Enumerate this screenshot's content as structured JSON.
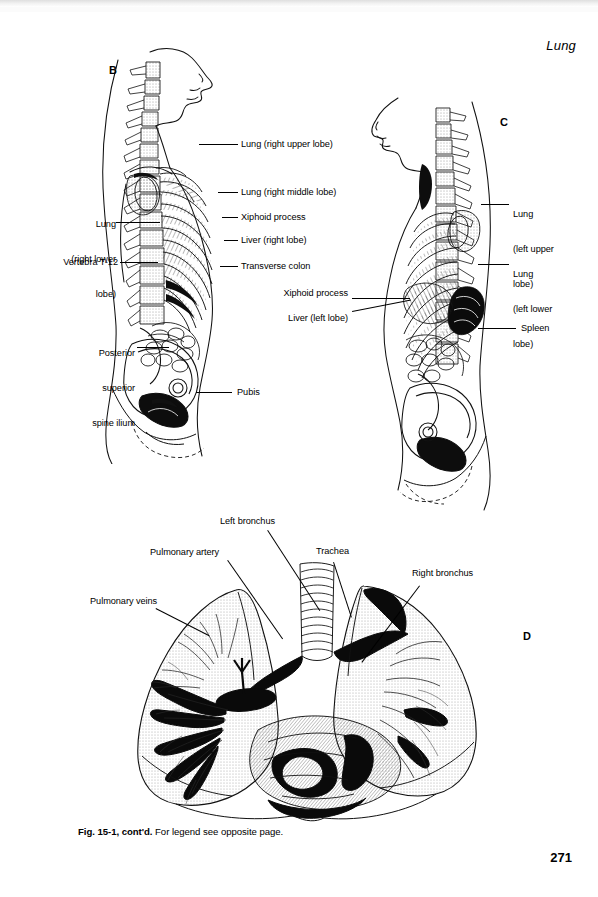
{
  "page": {
    "running_head": "Lung",
    "folio": "271",
    "caption_figure": "Fig. 15-1, cont'd.",
    "caption_text": " For legend see opposite page."
  },
  "panels": [
    {
      "letter": "B",
      "name": "panel-b-right-lateral-torso",
      "labels_left": [
        {
          "id": "lung-right-lower-lobe",
          "lines": [
            "Lung",
            "(right lower",
            "lobe)"
          ]
        },
        {
          "id": "vertebra-t12",
          "lines": [
            "Vertebra T-12"
          ]
        },
        {
          "id": "posterior-superior-spine-ilium",
          "lines": [
            "Posterior",
            "superior",
            "spine ilium"
          ]
        }
      ],
      "labels_right": [
        {
          "id": "lung-right-upper-lobe",
          "lines": [
            "Lung (right upper lobe)"
          ]
        },
        {
          "id": "lung-right-middle-lobe",
          "lines": [
            "Lung (right middle lobe)"
          ]
        },
        {
          "id": "xiphoid-process",
          "lines": [
            "Xiphoid process"
          ]
        },
        {
          "id": "liver-right-lobe",
          "lines": [
            "Liver (right lobe)"
          ]
        },
        {
          "id": "transverse-colon",
          "lines": [
            "Transverse colon"
          ]
        },
        {
          "id": "pubis",
          "lines": [
            "Pubis"
          ]
        }
      ]
    },
    {
      "letter": "C",
      "name": "panel-c-left-lateral-torso",
      "labels_left": [
        {
          "id": "xiphoid-process",
          "lines": [
            "Xiphoid process"
          ]
        },
        {
          "id": "liver-left-lobe",
          "lines": [
            "Liver (left lobe)"
          ]
        }
      ],
      "labels_right": [
        {
          "id": "lung-left-upper-lobe",
          "lines": [
            "Lung",
            "(left upper",
            "lobe)"
          ]
        },
        {
          "id": "lung-left-lower-lobe",
          "lines": [
            "Lung",
            "(left lower",
            "lobe)"
          ]
        },
        {
          "id": "spleen",
          "lines": [
            "Spleen"
          ]
        }
      ]
    },
    {
      "letter": "D",
      "name": "panel-d-lungs-bronchi",
      "labels": [
        {
          "id": "left-bronchus",
          "lines": [
            "Left bronchus"
          ]
        },
        {
          "id": "pulmonary-artery",
          "lines": [
            "Pulmonary artery"
          ]
        },
        {
          "id": "trachea",
          "lines": [
            "Trachea"
          ]
        },
        {
          "id": "right-bronchus",
          "lines": [
            "Right bronchus"
          ]
        },
        {
          "id": "pulmonary-veins",
          "lines": [
            "Pulmonary veins"
          ]
        }
      ]
    }
  ],
  "labels_flat": {
    "b_lung_right_lower_lobe_1": "Lung",
    "b_lung_right_lower_lobe_2": "(right lower",
    "b_lung_right_lower_lobe_3": "lobe)",
    "b_vertebra_t12": "Vertebra T-12",
    "b_posterior_1": "Posterior",
    "b_posterior_2": "superior",
    "b_posterior_3": "spine ilium",
    "b_lung_right_upper_lobe": "Lung (right upper lobe)",
    "b_lung_right_middle_lobe": "Lung (right middle lobe)",
    "b_xiphoid_process": "Xiphoid process",
    "b_liver_right_lobe": "Liver (right lobe)",
    "b_transverse_colon": "Transverse colon",
    "b_pubis": "Pubis",
    "c_xiphoid_process": "Xiphoid process",
    "c_liver_left_lobe": "Liver (left lobe)",
    "c_lung_left_upper_lobe_1": "Lung",
    "c_lung_left_upper_lobe_2": "(left upper",
    "c_lung_left_upper_lobe_3": "lobe)",
    "c_lung_left_lower_lobe_1": "Lung",
    "c_lung_left_lower_lobe_2": "(left lower",
    "c_lung_left_lower_lobe_3": "lobe)",
    "c_spleen": "Spleen",
    "d_left_bronchus": "Left bronchus",
    "d_pulmonary_artery": "Pulmonary artery",
    "d_trachea": "Trachea",
    "d_right_bronchus": "Right bronchus",
    "d_pulmonary_veins": "Pulmonary veins",
    "letter_b": "B",
    "letter_c": "C",
    "letter_d": "D"
  },
  "colors": {
    "ink": "#000000",
    "paper": "#ffffff",
    "shading": "#5a5a5a"
  }
}
